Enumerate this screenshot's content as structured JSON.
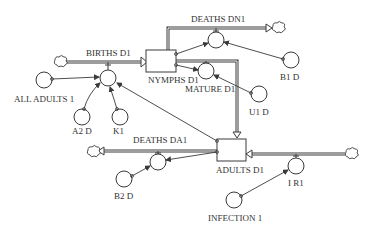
{
  "diagram": {
    "type": "stock-and-flow",
    "colors": {
      "line": "#3a3a3a",
      "background": "#ffffff",
      "text": "#333333"
    },
    "stocks": [
      {
        "id": "nymphs",
        "label": "NYMPHS D1"
      },
      {
        "id": "adults",
        "label": "ADULTS D1"
      }
    ],
    "flows": [
      {
        "id": "births",
        "label": "BIRTHS D1",
        "from": "cloud",
        "to": "nymphs"
      },
      {
        "id": "deaths_dn",
        "label": "DEATHS DN1",
        "from": "nymphs",
        "to": "cloud"
      },
      {
        "id": "mature",
        "label": "MATURE D1",
        "from": "nymphs",
        "to": "adults"
      },
      {
        "id": "deaths_da",
        "label": "DEATHS DA1",
        "from": "adults",
        "to": "cloud"
      },
      {
        "id": "ir",
        "label": "I R1",
        "from": "cloud",
        "to": "adults"
      }
    ],
    "converters": [
      {
        "id": "all_adults",
        "label": "ALL ADULTS 1"
      },
      {
        "id": "a2d",
        "label": "A2 D"
      },
      {
        "id": "k1",
        "label": "K1"
      },
      {
        "id": "b1d",
        "label": "B1 D"
      },
      {
        "id": "u1d",
        "label": "U1 D"
      },
      {
        "id": "b2d",
        "label": "B2 D"
      },
      {
        "id": "infection",
        "label": "INFECTION 1"
      }
    ]
  }
}
